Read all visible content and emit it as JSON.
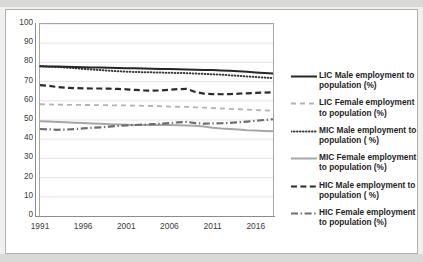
{
  "chart_data": {
    "type": "line",
    "title": "",
    "xlabel": "",
    "ylabel": "",
    "ylim": [
      0,
      100
    ],
    "ytick_step": 10,
    "yticks": [
      "100",
      "90",
      "80",
      "70",
      "60",
      "50",
      "40",
      "30",
      "20",
      "10",
      "0"
    ],
    "xticks": [
      "1991",
      "1996",
      "2001",
      "2006",
      "2011",
      "2016"
    ],
    "xlim": [
      1991,
      2018
    ],
    "grid": "horizontal",
    "legend_position": "right",
    "x": [
      1991,
      1992,
      1993,
      1994,
      1995,
      1996,
      1997,
      1998,
      1999,
      2000,
      2001,
      2002,
      2003,
      2004,
      2005,
      2006,
      2007,
      2008,
      2009,
      2010,
      2011,
      2012,
      2013,
      2014,
      2015,
      2016,
      2017,
      2018
    ],
    "series": [
      {
        "name": "LIC Male employment to population (%)",
        "short": "LIC Male",
        "style": "solid",
        "color": "#262626",
        "width": 2.0,
        "values": [
          78.0,
          77.9,
          77.8,
          77.7,
          77.6,
          77.5,
          77.4,
          77.3,
          77.2,
          77.1,
          77.0,
          76.9,
          76.8,
          76.7,
          76.6,
          76.5,
          76.4,
          76.3,
          76.2,
          76.1,
          76.0,
          75.8,
          75.6,
          75.4,
          75.1,
          74.8,
          74.5,
          74.2
        ]
      },
      {
        "name": "LIC Female employment to population (%)",
        "short": "LIC Female",
        "style": "dashed",
        "color": "#b3b3b3",
        "width": 1.8,
        "values": [
          58.2,
          58.1,
          58.0,
          57.9,
          57.9,
          57.8,
          57.8,
          57.7,
          57.7,
          57.6,
          57.6,
          57.5,
          57.4,
          57.3,
          57.2,
          57.0,
          56.9,
          56.8,
          56.6,
          56.4,
          56.2,
          56.0,
          55.8,
          55.6,
          55.4,
          55.2,
          55.0,
          54.8
        ]
      },
      {
        "name": "MIC Male employment to population ( %)",
        "short": "MIC Male",
        "style": "dotted",
        "color": "#3a3a3a",
        "width": 2.0,
        "values": [
          78.0,
          77.8,
          77.6,
          77.3,
          77.0,
          76.6,
          76.3,
          76.0,
          75.7,
          75.4,
          75.2,
          75.0,
          74.9,
          74.8,
          74.7,
          74.6,
          74.5,
          74.4,
          74.2,
          74.0,
          73.8,
          73.6,
          73.3,
          73.0,
          72.7,
          72.4,
          72.1,
          71.8
        ]
      },
      {
        "name": "MIC Female employment to population (%)",
        "short": "MIC Female",
        "style": "solid",
        "color": "#a6a6a6",
        "width": 2.0,
        "values": [
          49.3,
          49.2,
          49.0,
          48.8,
          48.6,
          48.4,
          48.2,
          48.0,
          47.8,
          47.7,
          47.5,
          47.4,
          47.4,
          47.4,
          47.4,
          47.4,
          47.3,
          47.2,
          47.0,
          46.6,
          46.0,
          45.6,
          45.3,
          45.0,
          44.7,
          44.5,
          44.3,
          44.1
        ]
      },
      {
        "name": "HIC Male employment to population ( %)",
        "short": "HIC Male",
        "style": "dash",
        "color": "#2b2b2b",
        "width": 2.2,
        "values": [
          68.2,
          67.8,
          67.2,
          66.8,
          66.6,
          66.5,
          66.4,
          66.4,
          66.3,
          66.2,
          66.0,
          65.7,
          65.4,
          65.3,
          65.4,
          65.7,
          66.1,
          66.2,
          64.6,
          63.7,
          63.5,
          63.4,
          63.5,
          63.7,
          63.9,
          64.1,
          64.3,
          64.4
        ]
      },
      {
        "name": "HIC Female employment to population (%)",
        "short": "HIC Female",
        "style": "dashdot",
        "color": "#6e6e6e",
        "width": 2.2,
        "values": [
          45.3,
          45.1,
          44.9,
          45.0,
          45.3,
          45.6,
          45.9,
          46.2,
          46.5,
          46.9,
          47.2,
          47.4,
          47.6,
          47.8,
          48.0,
          48.4,
          48.8,
          49.0,
          48.4,
          48.1,
          48.2,
          48.3,
          48.5,
          48.8,
          49.2,
          49.6,
          50.0,
          50.4
        ]
      }
    ]
  },
  "legend": {
    "items": [
      {
        "label": "LIC Male employment to population (%)"
      },
      {
        "label": "LIC Female employment to population (%)"
      },
      {
        "label": "MIC Male employment to population ( %)"
      },
      {
        "label": "MIC Female employment to population (%)"
      },
      {
        "label": "HIC Male employment to population ( %)"
      },
      {
        "label": "HIC Female employment to population (%)"
      }
    ]
  }
}
